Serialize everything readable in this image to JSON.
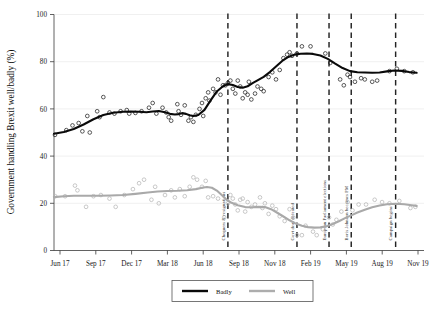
{
  "chart_data": {
    "type": "scatter",
    "title": "",
    "xlabel": "",
    "ylabel": "Government handling Brexit well/badly (%)",
    "ylim": [
      0,
      100
    ],
    "yticks": [
      0,
      20,
      40,
      60,
      80,
      100
    ],
    "ytick_labels": [
      "0",
      "20",
      "40",
      "60",
      "80",
      "100"
    ],
    "xtick_labels": [
      "Jun 17",
      "Sep 17",
      "Dec 17",
      "Mar 18",
      "Jun 18",
      "Sep 18",
      "Nov 18",
      "Feb 19",
      "May 19",
      "Aug 19",
      "Nov 19"
    ],
    "xlim": [
      "Jun 17",
      "Dec 19"
    ],
    "grid": "horizontal-light",
    "legend_position": "bottom-center",
    "legend": [
      {
        "name": "Badly",
        "color": "#0a0a0a"
      },
      {
        "name": "Well",
        "color": "#adadad"
      }
    ],
    "annotations": [
      {
        "label": "Chequers & resignations",
        "x": "Jul 18"
      },
      {
        "label": "Govt deal defeated",
        "x": "Jan 19"
      },
      {
        "label": "European Parliament elections",
        "x": "May 19"
      },
      {
        "label": "Boris Johnson becomes PM",
        "x": "Jul 19"
      },
      {
        "label": "Campaign begins",
        "x": "Oct 19"
      }
    ],
    "series": [
      {
        "name": "Badly",
        "color": "#0a0a0a",
        "fit_points": [
          [
            0.0,
            49.5
          ],
          [
            0.04,
            50.2
          ],
          [
            0.08,
            51.5
          ],
          [
            0.12,
            53.4
          ],
          [
            0.16,
            55.6
          ],
          [
            0.2,
            57.4
          ],
          [
            0.24,
            58.4
          ],
          [
            0.28,
            58.8
          ],
          [
            0.31,
            58.9
          ],
          [
            0.345,
            58.8
          ],
          [
            0.375,
            58.6
          ],
          [
            0.4,
            58.9
          ],
          [
            0.425,
            59.1
          ],
          [
            0.45,
            58.6
          ],
          [
            0.47,
            57.9
          ],
          [
            0.49,
            57.6
          ],
          [
            0.505,
            57.8
          ],
          [
            0.52,
            58.2
          ],
          [
            0.535,
            57.9
          ],
          [
            0.55,
            57.3
          ],
          [
            0.565,
            57.0
          ],
          [
            0.585,
            57.4
          ],
          [
            0.61,
            59.6
          ],
          [
            0.635,
            63.6
          ],
          [
            0.66,
            67.4
          ],
          [
            0.685,
            69.6
          ],
          [
            0.705,
            70.5
          ],
          [
            0.725,
            70.1
          ],
          [
            0.745,
            69.3
          ],
          [
            0.765,
            69.0
          ],
          [
            0.785,
            69.6
          ],
          [
            0.805,
            70.9
          ],
          [
            0.825,
            72.1
          ],
          [
            0.85,
            73.6
          ],
          [
            0.875,
            75.6
          ],
          [
            0.9,
            78.0
          ],
          [
            0.925,
            80.3
          ],
          [
            0.95,
            82.0
          ],
          [
            0.975,
            83.0
          ],
          [
            1.0,
            83.4
          ],
          [
            1.025,
            83.5
          ],
          [
            1.05,
            83.3
          ],
          [
            1.08,
            82.6
          ],
          [
            1.11,
            81.2
          ],
          [
            1.14,
            79.2
          ],
          [
            1.17,
            77.3
          ],
          [
            1.2,
            76.0
          ],
          [
            1.23,
            75.5
          ],
          [
            1.26,
            75.4
          ],
          [
            1.29,
            75.3
          ],
          [
            1.32,
            75.4
          ],
          [
            1.35,
            75.9
          ],
          [
            1.38,
            76.3
          ],
          [
            1.41,
            76.1
          ],
          [
            1.44,
            75.6
          ],
          [
            1.47,
            75.3
          ]
        ],
        "scatter": [
          [
            0.004,
            49.0
          ],
          [
            0.05,
            51.0
          ],
          [
            0.075,
            53.0
          ],
          [
            0.1,
            54.0
          ],
          [
            0.115,
            50.5
          ],
          [
            0.135,
            57.0
          ],
          [
            0.145,
            50.0
          ],
          [
            0.175,
            59.0
          ],
          [
            0.185,
            56.5
          ],
          [
            0.2,
            65.0
          ],
          [
            0.225,
            58.5
          ],
          [
            0.245,
            58.0
          ],
          [
            0.27,
            59.0
          ],
          [
            0.295,
            59.5
          ],
          [
            0.305,
            58.0
          ],
          [
            0.33,
            58.3
          ],
          [
            0.355,
            59.0
          ],
          [
            0.385,
            60.5
          ],
          [
            0.4,
            62.5
          ],
          [
            0.415,
            58.0
          ],
          [
            0.44,
            60.5
          ],
          [
            0.455,
            58.5
          ],
          [
            0.465,
            56.5
          ],
          [
            0.475,
            55.0
          ],
          [
            0.5,
            62.0
          ],
          [
            0.505,
            59.0
          ],
          [
            0.515,
            57.5
          ],
          [
            0.53,
            61.5
          ],
          [
            0.545,
            55.0
          ],
          [
            0.555,
            56.5
          ],
          [
            0.565,
            54.5
          ],
          [
            0.575,
            57.5
          ],
          [
            0.59,
            60.0
          ],
          [
            0.6,
            62.5
          ],
          [
            0.605,
            57.0
          ],
          [
            0.615,
            64.5
          ],
          [
            0.625,
            67.0
          ],
          [
            0.63,
            63.5
          ],
          [
            0.645,
            68.5
          ],
          [
            0.655,
            67.0
          ],
          [
            0.665,
            72.5
          ],
          [
            0.675,
            66.0
          ],
          [
            0.685,
            70.0
          ],
          [
            0.695,
            70.0
          ],
          [
            0.705,
            71.0
          ],
          [
            0.715,
            72.0
          ],
          [
            0.725,
            68.5
          ],
          [
            0.735,
            66.5
          ],
          [
            0.745,
            72.0
          ],
          [
            0.755,
            69.5
          ],
          [
            0.765,
            64.5
          ],
          [
            0.775,
            67.0
          ],
          [
            0.785,
            66.0
          ],
          [
            0.79,
            71.5
          ],
          [
            0.8,
            64.0
          ],
          [
            0.815,
            66.5
          ],
          [
            0.825,
            69.5
          ],
          [
            0.84,
            68.5
          ],
          [
            0.85,
            67.5
          ],
          [
            0.87,
            73.5
          ],
          [
            0.885,
            75.5
          ],
          [
            0.9,
            72.5
          ],
          [
            0.915,
            76.5
          ],
          [
            0.93,
            81.5
          ],
          [
            0.945,
            83.0
          ],
          [
            0.955,
            84.0
          ],
          [
            0.965,
            82.5
          ],
          [
            0.985,
            83.5
          ],
          [
            1.005,
            86.5
          ],
          [
            1.04,
            86.5
          ],
          [
            1.1,
            83.5
          ],
          [
            1.12,
            79.5
          ],
          [
            1.16,
            72.5
          ],
          [
            1.175,
            70.0
          ],
          [
            1.19,
            74.5
          ],
          [
            1.2,
            73.5
          ],
          [
            1.22,
            71.5
          ],
          [
            1.245,
            73.0
          ],
          [
            1.26,
            72.5
          ],
          [
            1.29,
            71.5
          ],
          [
            1.31,
            72.0
          ],
          [
            1.36,
            76.0
          ],
          [
            1.39,
            77.0
          ],
          [
            1.42,
            76.0
          ],
          [
            1.455,
            75.5
          ]
        ]
      },
      {
        "name": "Well",
        "color": "#adadad",
        "fit_points": [
          [
            0.0,
            22.6
          ],
          [
            0.04,
            23.0
          ],
          [
            0.08,
            23.2
          ],
          [
            0.13,
            23.2
          ],
          [
            0.18,
            23.2
          ],
          [
            0.23,
            23.3
          ],
          [
            0.28,
            23.5
          ],
          [
            0.33,
            24.0
          ],
          [
            0.38,
            24.6
          ],
          [
            0.42,
            25.0
          ],
          [
            0.46,
            25.2
          ],
          [
            0.5,
            25.3
          ],
          [
            0.54,
            25.5
          ],
          [
            0.575,
            26.0
          ],
          [
            0.6,
            26.6
          ],
          [
            0.62,
            26.9
          ],
          [
            0.64,
            26.6
          ],
          [
            0.66,
            25.4
          ],
          [
            0.68,
            23.5
          ],
          [
            0.7,
            21.5
          ],
          [
            0.72,
            20.2
          ],
          [
            0.745,
            19.2
          ],
          [
            0.775,
            18.4
          ],
          [
            0.805,
            18.3
          ],
          [
            0.83,
            18.5
          ],
          [
            0.855,
            18.4
          ],
          [
            0.88,
            17.5
          ],
          [
            0.905,
            16.0
          ],
          [
            0.93,
            14.4
          ],
          [
            0.955,
            12.8
          ],
          [
            0.98,
            11.4
          ],
          [
            1.005,
            10.5
          ],
          [
            1.03,
            9.9
          ],
          [
            1.055,
            9.7
          ],
          [
            1.08,
            9.8
          ],
          [
            1.105,
            10.3
          ],
          [
            1.13,
            11.2
          ],
          [
            1.155,
            12.4
          ],
          [
            1.18,
            13.7
          ],
          [
            1.205,
            14.9
          ],
          [
            1.23,
            16.1
          ],
          [
            1.26,
            17.3
          ],
          [
            1.29,
            18.3
          ],
          [
            1.32,
            19.1
          ],
          [
            1.35,
            19.6
          ],
          [
            1.385,
            19.8
          ],
          [
            1.42,
            19.6
          ],
          [
            1.45,
            19.2
          ],
          [
            1.47,
            18.9
          ]
        ],
        "scatter": [
          [
            0.005,
            23.0
          ],
          [
            0.045,
            23.0
          ],
          [
            0.085,
            27.5
          ],
          [
            0.095,
            25.5
          ],
          [
            0.13,
            18.5
          ],
          [
            0.16,
            23.0
          ],
          [
            0.19,
            23.5
          ],
          [
            0.225,
            22.0
          ],
          [
            0.25,
            18.5
          ],
          [
            0.285,
            23.5
          ],
          [
            0.32,
            26.0
          ],
          [
            0.345,
            28.5
          ],
          [
            0.365,
            30.0
          ],
          [
            0.395,
            21.5
          ],
          [
            0.41,
            27.0
          ],
          [
            0.425,
            20.0
          ],
          [
            0.45,
            23.5
          ],
          [
            0.475,
            25.5
          ],
          [
            0.49,
            22.5
          ],
          [
            0.51,
            26.0
          ],
          [
            0.53,
            23.0
          ],
          [
            0.55,
            27.0
          ],
          [
            0.565,
            31.0
          ],
          [
            0.58,
            30.0
          ],
          [
            0.6,
            27.0
          ],
          [
            0.615,
            29.5
          ],
          [
            0.625,
            22.5
          ],
          [
            0.645,
            23.0
          ],
          [
            0.665,
            22.0
          ],
          [
            0.69,
            14.0
          ],
          [
            0.705,
            20.0
          ],
          [
            0.715,
            23.5
          ],
          [
            0.725,
            22.0
          ],
          [
            0.735,
            19.5
          ],
          [
            0.745,
            17.0
          ],
          [
            0.755,
            21.5
          ],
          [
            0.765,
            22.0
          ],
          [
            0.775,
            16.5
          ],
          [
            0.785,
            20.5
          ],
          [
            0.8,
            18.5
          ],
          [
            0.815,
            19.5
          ],
          [
            0.835,
            22.5
          ],
          [
            0.845,
            18.0
          ],
          [
            0.855,
            20.0
          ],
          [
            0.87,
            15.5
          ],
          [
            0.885,
            19.0
          ],
          [
            0.9,
            17.5
          ],
          [
            0.915,
            14.5
          ],
          [
            0.935,
            12.5
          ],
          [
            0.955,
            17.5
          ],
          [
            0.97,
            14.0
          ],
          [
            0.985,
            6.5
          ],
          [
            1.005,
            6.5
          ],
          [
            1.02,
            10.5
          ],
          [
            1.05,
            8.0
          ],
          [
            1.065,
            6.5
          ],
          [
            1.09,
            9.0
          ],
          [
            1.115,
            14.0
          ],
          [
            1.13,
            11.0
          ],
          [
            1.145,
            13.0
          ],
          [
            1.165,
            16.5
          ],
          [
            1.19,
            20.5
          ],
          [
            1.21,
            17.0
          ],
          [
            1.235,
            19.5
          ],
          [
            1.265,
            19.5
          ],
          [
            1.3,
            21.5
          ],
          [
            1.33,
            20.5
          ],
          [
            1.36,
            20.0
          ],
          [
            1.4,
            21.0
          ],
          [
            1.445,
            18.0
          ],
          [
            1.465,
            18.5
          ]
        ]
      }
    ]
  }
}
